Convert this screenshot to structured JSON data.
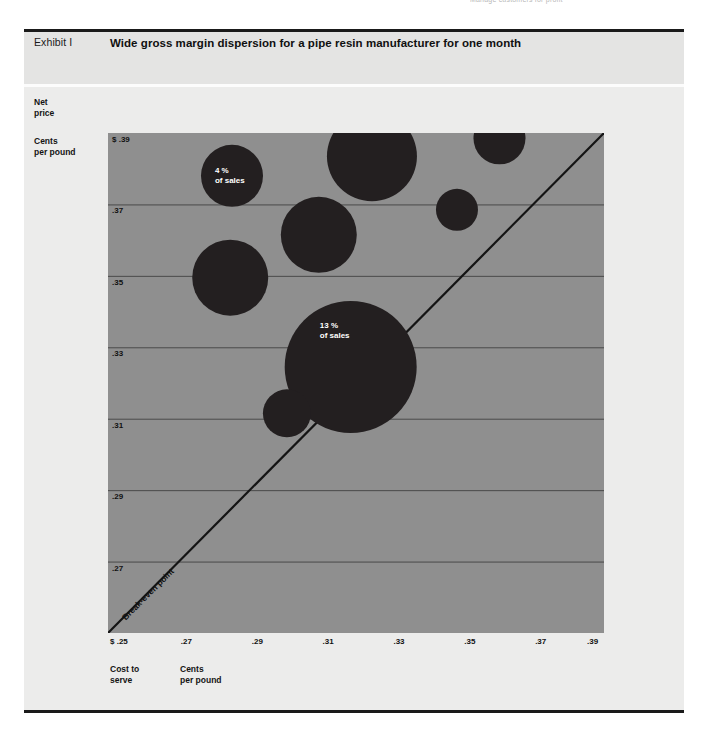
{
  "page": {
    "running_head": "Manage customers for profit"
  },
  "exhibit": {
    "label": "Exhibit I",
    "title": "Wide gross margin dispersion for a pipe resin manufacturer for one month"
  },
  "axes": {
    "y_title_line1": "Net",
    "y_title_line2": "price",
    "y_units_line1": "Cents",
    "y_units_line2": "per pound",
    "x_title_line1": "Cost to",
    "x_title_line2": "serve",
    "x_units_line1": "Cents",
    "x_units_line2": "per pound"
  },
  "chart_data": {
    "type": "scatter",
    "title": "Wide gross margin dispersion for a pipe resin manufacturer for one month",
    "xlabel": "Cost to serve (cents per pound)",
    "ylabel": "Net price (cents per pound)",
    "xlim": [
      0.25,
      0.39
    ],
    "ylim": [
      0.25,
      0.39
    ],
    "grid": "horizontal",
    "legend": "none",
    "x_ticks": [
      "$ .25",
      ".27",
      ".29",
      ".31",
      ".33",
      ".35",
      ".37",
      ".39"
    ],
    "x_tick_values": [
      0.25,
      0.27,
      0.29,
      0.31,
      0.33,
      0.35,
      0.37,
      0.39
    ],
    "y_ticks": [
      "$ .39",
      ".37",
      ".35",
      ".33",
      ".31",
      ".29",
      ".27"
    ],
    "y_tick_values": [
      0.39,
      0.37,
      0.35,
      0.33,
      0.31,
      0.29,
      0.27
    ],
    "reference_line": {
      "label": "Break-even point",
      "from": [
        0.25,
        0.25
      ],
      "to": [
        0.39,
        0.39
      ]
    },
    "bubbles": [
      {
        "x": 0.285,
        "y": 0.378,
        "r_px": 31,
        "label": "4 %\nof sales",
        "label_line1": "4 %",
        "label_line2": "of sales"
      },
      {
        "x": 0.3135,
        "y": 0.3345,
        "r_px": 24,
        "label": "13 %\nof sales",
        "label_line1": "13 %",
        "label_line2": "of sales"
      },
      {
        "x": 0.3245,
        "y": 0.3835,
        "r_px": 45,
        "label": ""
      },
      {
        "x": 0.3605,
        "y": 0.3885,
        "r_px": 26,
        "label": ""
      },
      {
        "x": 0.3485,
        "y": 0.3685,
        "r_px": 21,
        "label": ""
      },
      {
        "x": 0.3095,
        "y": 0.3615,
        "r_px": 38,
        "label": ""
      },
      {
        "x": 0.2845,
        "y": 0.3495,
        "r_px": 38,
        "label": ""
      },
      {
        "x": 0.3185,
        "y": 0.3245,
        "r_px": 66,
        "label": ""
      },
      {
        "x": 0.3005,
        "y": 0.3115,
        "r_px": 24,
        "label": ""
      }
    ]
  },
  "colors": {
    "bubble_fill": "#231f20",
    "plot_background": "#8f8f8f",
    "panel_background": "#ececeb",
    "rule": "#1a1a1a",
    "gridline": "#4a4a4a"
  }
}
